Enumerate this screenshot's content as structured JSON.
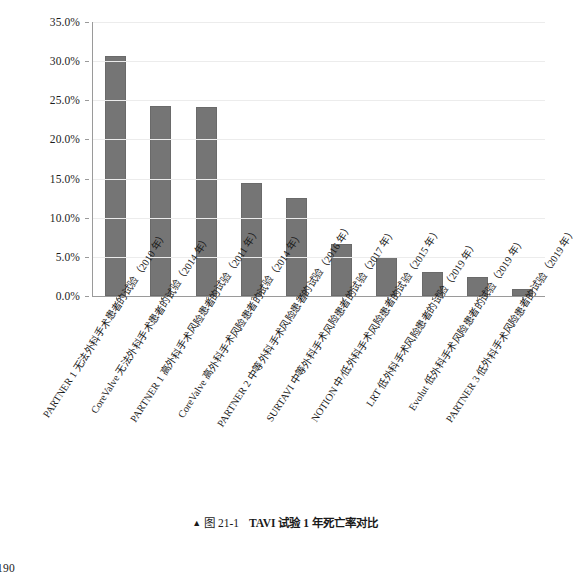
{
  "page": {
    "number": "190"
  },
  "caption": {
    "marker": "▲",
    "figure_number": "图 21-1",
    "title": "TAVI 试验 1 年死亡率对比"
  },
  "chart_data": {
    "type": "bar",
    "title": "",
    "xlabel": "",
    "ylabel": "",
    "ylim": [
      0,
      35
    ],
    "grid": true,
    "legend": false,
    "bar_color": "#757575",
    "categories": [
      "PARTNER 1 无法外科手术患者的试验（2010 年）",
      "CoreValve 无法外科手术患者的试验（2014 年）",
      "PARTNER 1 高外科手术风险患者的试验（2011 年）",
      "CoreValve 高外科手术风险患者的试验（2014 年）",
      "PARTNER 2 中等外科手术风险患者的试验（2016 年）",
      "SURTAVI 中等外科手术风险患者的试验（2017 年）",
      "NOTION 中/低外科手术风险患者的试验（2015 年）",
      "LRT 低外科手术风险患者的试验（2019 年）",
      "Evolut 低外科手术风险患者的试验（2019 年）",
      "PARTNER 3 低外科手术风险患者的试验（2019 年）"
    ],
    "values": [
      30.7,
      24.3,
      24.1,
      14.4,
      12.5,
      6.7,
      5.0,
      3.1,
      2.4,
      0.9
    ],
    "ytick_labels": [
      "0.0%",
      "5.0%",
      "10.0%",
      "15.0%",
      "20.0%",
      "25.0%",
      "30.0%",
      "35.0%"
    ],
    "ytick_values": [
      0,
      5,
      10,
      15,
      20,
      25,
      30,
      35
    ]
  }
}
